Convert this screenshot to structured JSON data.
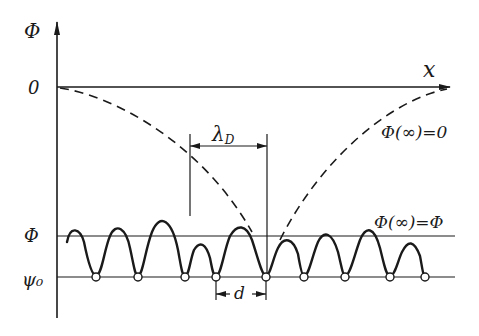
{
  "diagram": {
    "axes": {
      "y_label": "Φ",
      "x_label": "x",
      "origin_label": "0"
    },
    "levels": {
      "phi_label": "Φ",
      "psi0_label": "ψ₀"
    },
    "annotations": {
      "lambda_label": "λ",
      "lambda_subscript": "D",
      "d_label": "d",
      "phi_inf_zero": "Φ(∞)=0",
      "phi_inf_phi": "Φ(∞)=Φ"
    },
    "colors": {
      "ink": "#1a1a1a",
      "background": "#ffffff"
    },
    "minima_x": [
      96,
      138,
      185,
      216,
      266,
      304,
      345,
      390,
      425
    ]
  }
}
